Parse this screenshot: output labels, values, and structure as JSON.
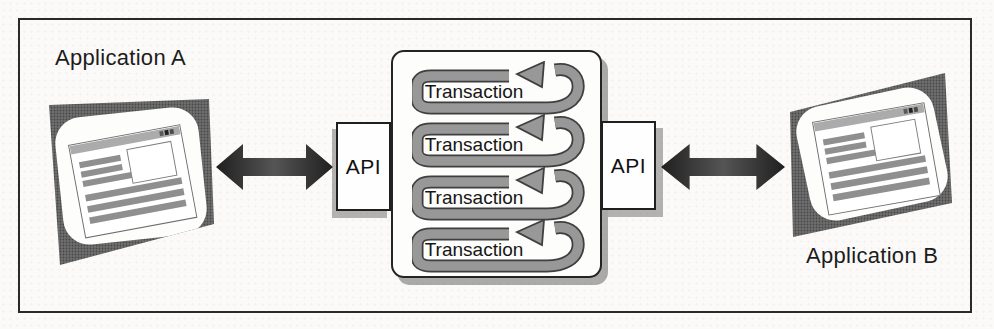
{
  "figure": {
    "app_a_label": "Application A",
    "app_b_label": "Application B",
    "api_left_label": "API",
    "api_right_label": "API",
    "transactions": [
      "Transaction",
      "Transaction",
      "Transaction",
      "Transaction"
    ],
    "icons": {
      "app_a": "browser-window-icon",
      "app_b": "browser-window-icon",
      "arrow_left": "bidirectional-arrow-icon",
      "arrow_right": "bidirectional-arrow-icon",
      "transaction": "loop-arrow-icon"
    },
    "colors": {
      "band_gray": "#989898",
      "outline_dark": "#3f3f3f",
      "bar_gray": "#8f8f8f",
      "arrow_dark_a": "#1f1f1f",
      "arrow_dark_b": "#555555",
      "frame_border": "#2a2a2a"
    }
  }
}
